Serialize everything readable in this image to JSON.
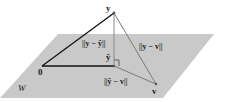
{
  "diagram": {
    "type": "orthogonal-projection",
    "plane": {
      "label": "W",
      "fill": "#c9c9c9",
      "corners": [
        [
          58,
          34
        ],
        [
          214,
          34
        ],
        [
          163,
          98
        ],
        [
          0,
          98
        ]
      ]
    },
    "points": {
      "y": {
        "label": "y",
        "x": 114,
        "y": 13
      },
      "y_hat": {
        "label": "ŷ",
        "x": 114,
        "y": 66
      },
      "zero": {
        "label": "0",
        "x": 42,
        "y": 66
      },
      "v": {
        "label": "v",
        "x": 156,
        "y": 85
      }
    },
    "segments": [
      {
        "from": "zero",
        "to": "y",
        "color": "#111111",
        "width": 1.3
      },
      {
        "from": "zero",
        "to": "y_hat",
        "color": "#111111",
        "width": 1.3
      },
      {
        "from": "y",
        "to": "y_hat",
        "color": "#8a8a8a",
        "width": 1.0
      },
      {
        "from": "y",
        "to": "v",
        "color": "#7a7a7a",
        "width": 1.0
      },
      {
        "from": "y_hat",
        "to": "v",
        "color": "#7a7a7a",
        "width": 1.0
      }
    ],
    "distance_labels": {
      "y_minus_yhat": "||y − ŷ||",
      "y_minus_v": "||y − v||",
      "yhat_minus_v": "||ŷ − v||"
    },
    "right_angle_marker": true
  }
}
